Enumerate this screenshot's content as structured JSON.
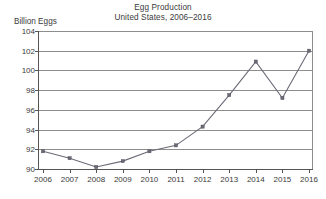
{
  "chart_data": {
    "type": "line",
    "title": "Egg Production",
    "subtitle": "United States, 2006–2016",
    "ylabel": "Billion Eggs",
    "xlabel": "",
    "categories": [
      "2006",
      "2007",
      "2008",
      "2009",
      "2010",
      "2011",
      "2012",
      "2013",
      "2014",
      "2015",
      "2016"
    ],
    "values": [
      91.8,
      91.1,
      90.2,
      90.8,
      91.8,
      92.4,
      94.3,
      97.5,
      100.9,
      97.2,
      102.0
    ],
    "ylim": [
      90,
      104
    ],
    "yticks": [
      90,
      92,
      94,
      96,
      98,
      100,
      102,
      104
    ],
    "ytick_labels": [
      "90",
      "92",
      "94",
      "96",
      "98",
      "100",
      "102",
      "104"
    ],
    "grid": true,
    "legend": "none",
    "series_color": "#6b6b78",
    "grid_color": "#8e8e8e",
    "axis_color": "#555555",
    "text_color": "#3a3a3a",
    "background": "#ffffff",
    "marker": "square"
  }
}
